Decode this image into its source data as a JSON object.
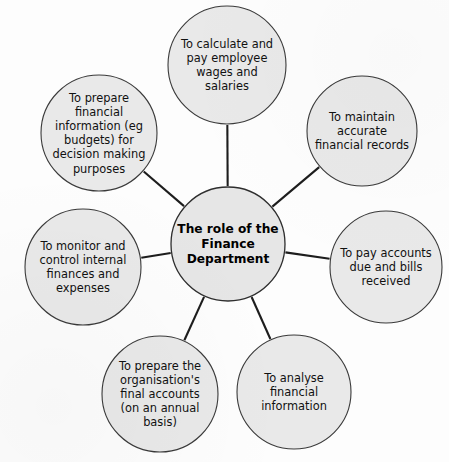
{
  "diagram": {
    "type": "hub-and-spoke",
    "background_color": "#fdfdfd",
    "node_fill_color": "#e9e9e9",
    "node_stroke_color": "#3a3a3a",
    "connector_color": "#1d1d1d",
    "center": {
      "label": "The role of the Finance Department",
      "lines": [
        "The role of the",
        "Finance",
        "Department"
      ],
      "cx": 228,
      "cy": 244,
      "r": 57
    },
    "nodes": [
      {
        "id": "calculate-pay-wages",
        "label": "To calculate and pay employee wages and salaries",
        "lines": [
          "To calculate and",
          "pay employee",
          "wages and",
          "salaries"
        ],
        "cx": 227,
        "cy": 65,
        "r": 59
      },
      {
        "id": "maintain-accurate-records",
        "label": "To maintain accurate financial records",
        "lines": [
          "To maintain",
          "accurate",
          "financial records"
        ],
        "cx": 362,
        "cy": 131,
        "r": 55
      },
      {
        "id": "pay-accounts-bills",
        "label": "To pay accounts due and bills received",
        "lines": [
          "To pay accounts",
          "due and bills",
          "received"
        ],
        "cx": 386,
        "cy": 267,
        "r": 56
      },
      {
        "id": "analyse-financial-information",
        "label": "To analyse financial information",
        "lines": [
          "To analyse",
          "financial",
          "information"
        ],
        "cx": 294,
        "cy": 392,
        "r": 57
      },
      {
        "id": "prepare-final-accounts",
        "label": "To prepare the organisation's final accounts (on an annual basis)",
        "lines": [
          "To prepare the",
          "organisation's",
          "final accounts",
          "(on an annual",
          "basis)"
        ],
        "cx": 160,
        "cy": 394,
        "r": 58
      },
      {
        "id": "monitor-control-finances",
        "label": "To monitor and control internal finances and expenses",
        "lines": [
          "To monitor and",
          "control internal",
          "finances and",
          "expenses"
        ],
        "cx": 83,
        "cy": 267,
        "r": 58
      },
      {
        "id": "prepare-financial-information",
        "label": "To prepare financial information (eg budgets) for decision making purposes",
        "lines": [
          "To prepare",
          "financial",
          "information (eg",
          "budgets) for",
          "decision making",
          "purposes"
        ],
        "cx": 99,
        "cy": 133,
        "r": 58
      }
    ]
  }
}
